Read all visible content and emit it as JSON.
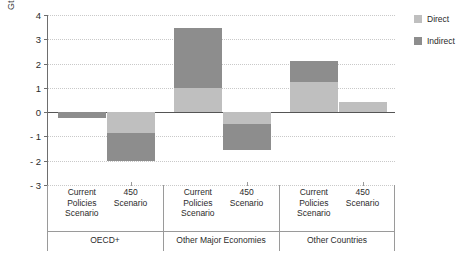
{
  "chart_data": {
    "type": "bar",
    "stacked": true,
    "title": "",
    "xlabel": "",
    "ylabel": "Gt",
    "ylim": [
      -3,
      4
    ],
    "yticks": [
      4,
      3,
      2,
      1,
      0,
      -1,
      -2,
      -3
    ],
    "ytick_labels": [
      "4",
      "3",
      "2",
      "1",
      "0",
      "- 1",
      "- 2",
      "- 3"
    ],
    "grid": true,
    "legend_position": "right",
    "groups": [
      {
        "name": "OECD+",
        "categories": [
          "Current Policies Scenario",
          "450 Scenario"
        ]
      },
      {
        "name": "Other Major Economies",
        "categories": [
          "Current Policies Scenario",
          "450 Scenario"
        ]
      },
      {
        "name": "Other Countries",
        "categories": [
          "Current Policies Scenario",
          "450 Scenario"
        ]
      }
    ],
    "categories": [
      "OECD+ / Current Policies Scenario",
      "OECD+ / 450 Scenario",
      "Other Major Economies / Current Policies Scenario",
      "Other Major Economies / 450 Scenario",
      "Other Countries / Current Policies Scenario",
      "Other Countries / 450 Scenario"
    ],
    "series": [
      {
        "name": "Direct",
        "color": "#bfbfbf",
        "values": [
          0.0,
          -0.85,
          1.0,
          -0.5,
          1.25,
          0.42
        ]
      },
      {
        "name": "Indirect",
        "color": "#8d8d8d",
        "values": [
          -0.25,
          -1.15,
          2.45,
          -1.05,
          0.87,
          0.0
        ]
      }
    ],
    "totals": [
      -0.25,
      -2.0,
      3.45,
      -1.55,
      2.12,
      0.42
    ],
    "bars": [
      {
        "label": "Current Policies Scenario",
        "group": "OECD+",
        "direct": 0.0,
        "indirect": -0.25,
        "direct_from": 0.0,
        "direct_to": 0.0,
        "indirect_from": 0.0,
        "indirect_to": -0.25
      },
      {
        "label": "450 Scenario",
        "group": "OECD+",
        "direct": -0.85,
        "indirect": -1.15,
        "direct_from": 0.0,
        "direct_to": -0.85,
        "indirect_from": -0.85,
        "indirect_to": -2.0
      },
      {
        "label": "Current Policies Scenario",
        "group": "Other Major Economies",
        "direct": 1.0,
        "indirect": 2.45,
        "direct_from": 0.0,
        "direct_to": 1.0,
        "indirect_from": 1.0,
        "indirect_to": 3.45
      },
      {
        "label": "450 Scenario",
        "group": "Other Major Economies",
        "direct": -0.5,
        "indirect": -1.05,
        "direct_from": 0.0,
        "direct_to": -0.5,
        "indirect_from": -0.5,
        "indirect_to": -1.55
      },
      {
        "label": "Current Policies Scenario",
        "group": "Other Countries",
        "direct": 1.25,
        "indirect": 0.87,
        "direct_from": 0.0,
        "direct_to": 1.25,
        "indirect_from": 1.25,
        "indirect_to": 2.12
      },
      {
        "label": "450 Scenario",
        "group": "Other Countries",
        "direct": 0.42,
        "indirect": 0.0,
        "direct_from": 0.0,
        "direct_to": 0.42,
        "indirect_from": 0.42,
        "indirect_to": 0.42
      }
    ]
  },
  "axis": {
    "unit_label": "Gt"
  },
  "legend": {
    "items": [
      {
        "label": "Direct",
        "color": "#bfbfbf"
      },
      {
        "label": "Indirect",
        "color": "#8d8d8d"
      }
    ]
  },
  "scenario_labels": {
    "current_policies": "Current\nPolicies\nScenario",
    "scenario_450": "450\nScenario"
  }
}
